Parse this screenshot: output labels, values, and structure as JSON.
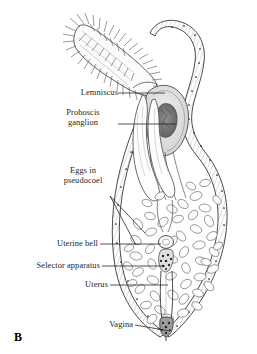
{
  "figure": {
    "panel_letter": "B",
    "background_color": "#ffffff",
    "ink_color": "#1c1c1c",
    "labels": [
      {
        "id": "lemniscus",
        "text": "Lemniscus",
        "align": "right",
        "x": 55,
        "y": 88,
        "leader": [
          [
            118,
            93
          ],
          [
            165,
            93
          ]
        ]
      },
      {
        "id": "proboscis-ganglion",
        "text": "Proboscis\nganglion",
        "line1": "Proboscis",
        "line2": "ganglion",
        "align": "center",
        "x": 57,
        "y": 112,
        "leader": [
          [
            118,
            124
          ],
          [
            176,
            124
          ]
        ]
      },
      {
        "id": "eggs-in-pseudocoel",
        "text": "Eggs in\npseudocoel",
        "line1": "Eggs in",
        "line2": "pseudocoel",
        "align": "center",
        "x": 74,
        "y": 170,
        "leader": [
          [
            110,
            196
          ],
          [
            145,
            233
          ]
        ],
        "leader2": [
          [
            110,
            196
          ],
          [
            136,
            245
          ]
        ]
      },
      {
        "id": "uterine-bell",
        "text": "Uterine bell",
        "align": "right",
        "x": 41,
        "y": 239,
        "leader": [
          [
            100,
            244
          ],
          [
            163,
            244
          ]
        ]
      },
      {
        "id": "selector-apparatus",
        "text": "Selector apparatus",
        "align": "right",
        "x": 8,
        "y": 261,
        "leader": [
          [
            102,
            266
          ],
          [
            167,
            266
          ]
        ]
      },
      {
        "id": "uterus",
        "text": "Uterus",
        "align": "right",
        "x": 74,
        "y": 280,
        "leader": [
          [
            110,
            285
          ],
          [
            168,
            285
          ]
        ]
      },
      {
        "id": "vagina",
        "text": "Vagina",
        "align": "right",
        "x": 98,
        "y": 320,
        "leader": [
          [
            135,
            325
          ],
          [
            172,
            331
          ]
        ]
      }
    ]
  }
}
